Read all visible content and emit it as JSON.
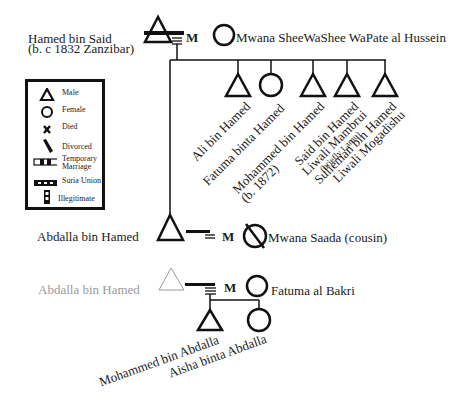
{
  "diagram_type": "genealogy",
  "generation1": {
    "husband": {
      "name": "Hamed bin Said",
      "note": "(b. c 1832 Zanzibar)",
      "sex": "male"
    },
    "wife": {
      "name": "Mwana SheeWaShee WaPate al Hussein",
      "sex": "female"
    },
    "union_marker": "M"
  },
  "children_gen2": [
    {
      "name": "Ali bin Hamed",
      "sex": "male"
    },
    {
      "name": "Fatuma binta Hamed",
      "sex": "female"
    },
    {
      "name": "Mohammed bin Hamed",
      "note": "(b. 1872)",
      "sex": "male"
    },
    {
      "name": "Said bin Hamed",
      "title": "Liwali Mambrui",
      "note": "(briefly Lamu)",
      "sex": "male"
    },
    {
      "name": "Sulieman bin Hamed",
      "title": "Liwali Mogadishu",
      "sex": "male"
    }
  ],
  "generation2_marriage1": {
    "husband": {
      "name": "Abdalla bin Hamed",
      "sex": "male"
    },
    "wife": {
      "name": "Mwana Saada (cousin)",
      "sex": "female",
      "status": "divorced"
    },
    "union_marker": "M"
  },
  "generation2_marriage2": {
    "husband": {
      "name": "Abdalla bin Hamed",
      "sex": "male",
      "repeat": true
    },
    "wife": {
      "name": "Fatuma al Bakri",
      "sex": "female"
    },
    "union_marker": "M"
  },
  "children_gen3": [
    {
      "name": "Mohammed bin Abdalla",
      "sex": "male"
    },
    {
      "name": "Aisha binta Abdalla",
      "sex": "female"
    }
  ],
  "legend": {
    "items": [
      {
        "symbol": "triangle-icon",
        "label": "Male"
      },
      {
        "symbol": "circle-icon",
        "label": "Female"
      },
      {
        "symbol": "x-icon",
        "label": "Died"
      },
      {
        "symbol": "slash-icon",
        "label": "Divorced"
      },
      {
        "symbol": "temporary-marriage-icon",
        "label": "Temporary",
        "label2": "Marriage"
      },
      {
        "symbol": "suria-union-icon",
        "label": "Suria Union"
      },
      {
        "symbol": "illegitimate-icon",
        "label": "Illegitimate"
      }
    ]
  },
  "colors": {
    "line": "#111111",
    "ghost": "#9a9a9a",
    "background": "#ffffff"
  }
}
